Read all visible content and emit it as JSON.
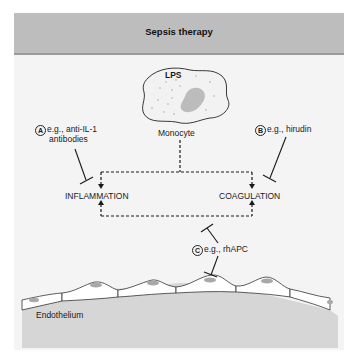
{
  "header": {
    "title": "Sepsis therapy"
  },
  "nodes": {
    "lps": "LPS",
    "monocyte": "Monocyte",
    "inflammation": "INFLAMMATION",
    "coagulation": "COAGULATION",
    "endothelium": "Endothelium"
  },
  "therapies": [
    {
      "marker": "A",
      "line1": "e.g., anti-IL-1",
      "line2": "antibodies",
      "target": "INFLAMMATION"
    },
    {
      "marker": "B",
      "line1": "e.g., hirudin",
      "target": "COAGULATION"
    },
    {
      "marker": "C",
      "line1": "e.g., rhAPC",
      "target": "INFLAMMATION-COAGULATION loop"
    }
  ],
  "colors": {
    "header_bg": "#bdbdbd",
    "panel_bg": "#f4f4f4",
    "tissue": "#d2d2d2",
    "nucleus": "#a8a8a8",
    "line": "#1a1a1a"
  }
}
